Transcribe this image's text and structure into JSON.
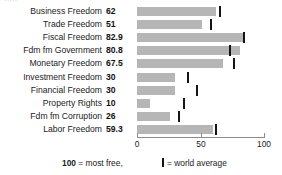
{
  "chart_data": {
    "type": "bar",
    "orientation": "horizontal",
    "title": "",
    "xlabel": "",
    "ylabel": "",
    "xlim": [
      0,
      100
    ],
    "grid": false,
    "categories": [
      "Business Freedom",
      "Trade Freedom",
      "Fiscal Freedom",
      "Fdm fm Government",
      "Monetary Freedom",
      "Investment Freedom",
      "Financial Freedom",
      "Property Rights",
      "Fdm fm Corruption",
      "Labor Freedom"
    ],
    "values": [
      62,
      51,
      82.9,
      80.8,
      67.5,
      30,
      30,
      10,
      26,
      59.3
    ],
    "value_labels": [
      "62",
      "51",
      "82.9",
      "80.8",
      "67.5",
      "30",
      "30",
      "10",
      "26",
      "59.3"
    ],
    "world_average": [
      64.5,
      57.5,
      83.5,
      73,
      76,
      40,
      47,
      37,
      33,
      62
    ],
    "series": [
      {
        "name": "Country score",
        "values": [
          62,
          51,
          82.9,
          80.8,
          67.5,
          30,
          30,
          10,
          26,
          59.3
        ],
        "color": "#b6b6b6"
      },
      {
        "name": "world average",
        "type": "marker",
        "values": [
          64.5,
          57.5,
          83.5,
          73,
          76,
          40,
          47,
          37,
          33,
          62
        ],
        "color": "#141414"
      }
    ],
    "xticks": [
      0,
      50,
      100
    ],
    "xticklabels": [
      "0",
      "50",
      "100"
    ],
    "legend": {
      "position": "bottom",
      "entries": [
        {
          "text_bold": "100",
          "text_rest": " = most free,"
        },
        {
          "marker": "world-average-tick",
          "text": "= world average"
        }
      ]
    },
    "top_cutoff_text": "·····"
  },
  "axis": {
    "tick_0": "0",
    "tick_50": "50",
    "tick_100": "100"
  },
  "legend": {
    "most_free_value": "100",
    "most_free_text": " = most free,",
    "world_average_text": "= world average"
  },
  "colors": {
    "bar": "#b6b6b6",
    "marker": "#141414",
    "axis": "#8c8c8c",
    "text": "#1b1b1b"
  }
}
